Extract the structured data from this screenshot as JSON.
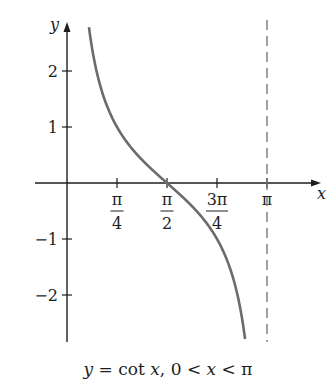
{
  "chart_data": {
    "type": "line",
    "title": "",
    "caption": "y = cot x, 0 < x < π",
    "xlabel": "x",
    "ylabel": "y",
    "function": "cot(x)",
    "domain": [
      0,
      3.14159265
    ],
    "xlim": [
      -0.95,
      3.6
    ],
    "ylim": [
      -2.8,
      2.85
    ],
    "x_ticks": [
      {
        "value": 0.7854,
        "label_num": "π",
        "label_den": "4"
      },
      {
        "value": 1.5708,
        "label_num": "π",
        "label_den": "2"
      },
      {
        "value": 2.3562,
        "label_num": "3π",
        "label_den": "4"
      },
      {
        "value": 3.1416,
        "label": "π"
      }
    ],
    "y_ticks": [
      {
        "value": 2,
        "label": "2"
      },
      {
        "value": 1,
        "label": "1"
      },
      {
        "value": -1,
        "label": "−1"
      },
      {
        "value": -2,
        "label": "−2"
      }
    ],
    "asymptotes": [
      {
        "x": 3.1416,
        "style": "dashed"
      }
    ],
    "sample_points": [
      {
        "x": 0.3491,
        "y": 2.75
      },
      {
        "x": 0.5236,
        "y": 1.732
      },
      {
        "x": 0.7854,
        "y": 1.0
      },
      {
        "x": 1.0472,
        "y": 0.577
      },
      {
        "x": 1.5708,
        "y": 0.0
      },
      {
        "x": 2.0944,
        "y": -0.577
      },
      {
        "x": 2.3562,
        "y": -1.0
      },
      {
        "x": 2.618,
        "y": -1.732
      },
      {
        "x": 2.7925,
        "y": -2.75
      }
    ],
    "grid": false,
    "legend": null
  },
  "style": {
    "axis_color": "#1e1e1e",
    "curve_color": "#6b6b6b",
    "asymptote_color": "#7a7a7a"
  }
}
